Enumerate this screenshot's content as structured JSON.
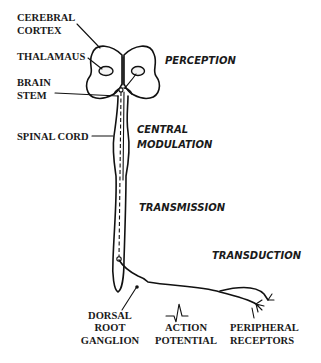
{
  "diagram": {
    "anatomy_labels": {
      "cerebral_cortex": [
        "CEREBRAL",
        "CORTEX"
      ],
      "thalamus": [
        "THALAMAUS"
      ],
      "brain_stem": [
        "BRAIN",
        "STEM"
      ],
      "spinal_cord": [
        "SPINAL CORD"
      ],
      "dorsal_root_ganglion": [
        "DORSAL",
        "ROOT",
        "GANGLION"
      ],
      "action_potential": [
        "ACTION",
        "POTENTIAL"
      ],
      "peripheral_receptors": [
        "PERIPHERAL",
        "RECEPTORS"
      ]
    },
    "process_labels": {
      "perception": [
        "PERCEPTION"
      ],
      "central_modulation": [
        "CENTRAL",
        "MODULATION"
      ],
      "transmission": [
        "TRANSMISSION"
      ],
      "transduction": [
        "TRANSDUCTION"
      ]
    },
    "colors": {
      "ink": "#111111",
      "background": "#ffffff"
    }
  }
}
